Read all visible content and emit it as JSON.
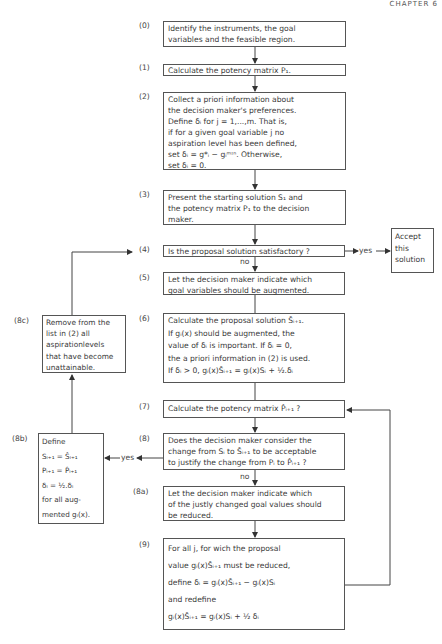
{
  "header": "CHAPTER 6",
  "steps": [
    {
      "id": "(0)",
      "lines": [
        "Identify the instruments, the goal",
        "variables and the feasible region."
      ]
    },
    {
      "id": "(1)",
      "lines": [
        "Calculate the potency matrix P₁."
      ]
    },
    {
      "id": "(2)",
      "lines": [
        "Collect a priori information about",
        "the decision maker's preferences.",
        "Define δᵢ for j = 1,...,m. That is,",
        "if for a given goal variable j no",
        "aspiration level has been defined,",
        "set δᵢ = g*ᵢ − gᵢᵐᶦⁿ. Otherwise,",
        "set δᵢ = 0."
      ]
    },
    {
      "id": "(3)",
      "lines": [
        "Present the starting solution S₁ and",
        "the potency matrix P₁ to the decision",
        "maker."
      ]
    },
    {
      "id": "(4)",
      "lines": [
        "Is the proposal solution satisfactory ?"
      ]
    },
    {
      "id": "(5)",
      "lines": [
        "Let the decision maker indicate which",
        "goal variables should be augmented."
      ]
    },
    {
      "id": "(6)",
      "lines": [
        "Calculate the proposal solution Ŝᵢ₊₁.",
        "If  gᵢ(x) should be augmented, the",
        "value of  δᵢ is important. If δᵢ = 0,",
        "the a priori information in (2) is used.",
        "If δᵢ > 0, gᵢ(x)Ŝᵢ₊₁ = gᵢ(x)Sᵢ + ½.δᵢ"
      ]
    },
    {
      "id": "(7)",
      "lines": [
        "Calculate the potency matrix P̂ᵢ₊₁ ?"
      ]
    },
    {
      "id": "(8)",
      "lines": [
        "Does the decision maker consider the",
        "change from Sᵢ to Ŝᵢ₊₁ to be acceptable",
        "to justify the change from Pᵢ to P̂ᵢ₊₁ ?"
      ]
    },
    {
      "id": "(8a)",
      "lines": [
        "Let the decision maker indicate which",
        "of the justly changed goal values should",
        "be reduced."
      ]
    },
    {
      "id": "(9)",
      "lines": [
        "For all j, for wich the proposal",
        "value gᵢ(x)Ŝᵢ₊₁   must be reduced,",
        "define δᵢ = gᵢ(x)Ŝᵢ₊₁ − gᵢ(x)Sᵢ",
        "and redefine",
        "gᵢ(x)Ŝᵢ₊₁ = gᵢ(x)Sᵢ + ½ δᵢ"
      ]
    },
    {
      "id": "(8b)",
      "lines": [
        "Define",
        "Sᵢ₊₁ = Ŝᵢ₊₁",
        "Pᵢ₊₁ = P̂ᵢ₊₁",
        "δᵢ     = ½.δᵢ",
        "for all aug-",
        "mented gᵢ(x)."
      ]
    },
    {
      "id": "(8c)",
      "lines": [
        "Remove from the",
        "list in (2) all",
        "aspirationlevels",
        "that have become",
        "unattainable."
      ]
    }
  ],
  "accept": {
    "lines": [
      "Accept",
      "this",
      "solution"
    ]
  },
  "edge_labels": {
    "yes_4": "yes",
    "no_4": "no",
    "yes_8": "yes",
    "no_8": "no"
  }
}
